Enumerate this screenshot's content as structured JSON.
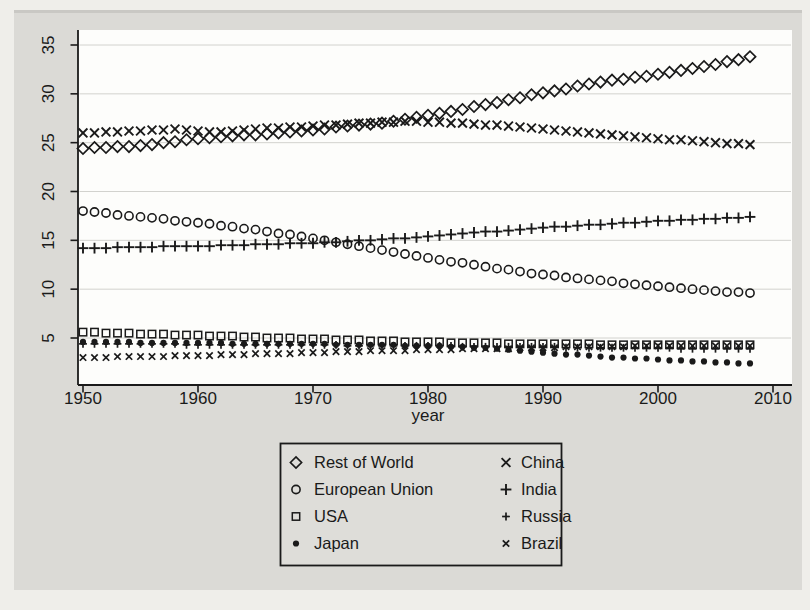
{
  "figure": {
    "xlabel": "year",
    "page_background": "#efeeea",
    "scan_background": "#dbdad6",
    "plot_background": "#fdfdfb",
    "ink_color": "#1a1a1a",
    "grid_color": "#d2d2ce",
    "legend_background": "#deddd9"
  },
  "chart_data": {
    "type": "scatter",
    "title": "",
    "xlabel": "year",
    "ylabel": "",
    "xlim": [
      1949.5,
      2011.5
    ],
    "ylim": [
      0.2,
      36.5
    ],
    "xticks": [
      1950,
      1960,
      1970,
      1980,
      1990,
      2000,
      2010
    ],
    "yticks": [
      5,
      10,
      15,
      20,
      25,
      30,
      35
    ],
    "grid": "horizontal",
    "legend_position": "below-plot",
    "legend_columns": [
      [
        0,
        1,
        2,
        3
      ],
      [
        4,
        5,
        6,
        7
      ]
    ],
    "x": [
      1950,
      1951,
      1952,
      1953,
      1954,
      1955,
      1956,
      1957,
      1958,
      1959,
      1960,
      1961,
      1962,
      1963,
      1964,
      1965,
      1966,
      1967,
      1968,
      1969,
      1970,
      1971,
      1972,
      1973,
      1974,
      1975,
      1976,
      1977,
      1978,
      1979,
      1980,
      1981,
      1982,
      1983,
      1984,
      1985,
      1986,
      1987,
      1988,
      1989,
      1990,
      1991,
      1992,
      1993,
      1994,
      1995,
      1996,
      1997,
      1998,
      1999,
      2000,
      2001,
      2002,
      2003,
      2004,
      2005,
      2006,
      2007,
      2008
    ],
    "series": [
      {
        "name": "Rest of World",
        "marker": "diamond-hollow",
        "values": [
          24.4,
          24.5,
          24.5,
          24.6,
          24.6,
          24.7,
          24.8,
          25.0,
          25.1,
          25.3,
          25.4,
          25.5,
          25.6,
          25.7,
          25.8,
          25.8,
          25.9,
          26.0,
          26.1,
          26.2,
          26.3,
          26.4,
          26.6,
          26.7,
          26.8,
          26.9,
          27.0,
          27.2,
          27.4,
          27.6,
          27.8,
          28.0,
          28.2,
          28.4,
          28.7,
          28.9,
          29.1,
          29.4,
          29.6,
          29.9,
          30.1,
          30.3,
          30.5,
          30.8,
          31.0,
          31.2,
          31.4,
          31.5,
          31.7,
          31.8,
          32.0,
          32.2,
          32.4,
          32.6,
          32.8,
          33.0,
          33.3,
          33.5,
          33.8
        ]
      },
      {
        "name": "European Union",
        "marker": "circle-hollow",
        "values": [
          18.0,
          17.9,
          17.8,
          17.6,
          17.5,
          17.4,
          17.3,
          17.2,
          17.0,
          16.9,
          16.8,
          16.7,
          16.5,
          16.4,
          16.2,
          16.1,
          15.9,
          15.7,
          15.6,
          15.4,
          15.2,
          15.0,
          14.8,
          14.6,
          14.4,
          14.2,
          14.0,
          13.8,
          13.6,
          13.4,
          13.2,
          13.0,
          12.8,
          12.7,
          12.5,
          12.3,
          12.1,
          12.0,
          11.8,
          11.6,
          11.5,
          11.4,
          11.2,
          11.1,
          11.0,
          10.9,
          10.8,
          10.6,
          10.5,
          10.4,
          10.3,
          10.2,
          10.1,
          10.0,
          9.9,
          9.8,
          9.7,
          9.7,
          9.6
        ]
      },
      {
        "name": "USA",
        "marker": "square-hollow",
        "values": [
          5.6,
          5.6,
          5.5,
          5.5,
          5.5,
          5.4,
          5.4,
          5.4,
          5.3,
          5.3,
          5.3,
          5.2,
          5.2,
          5.2,
          5.1,
          5.1,
          5.0,
          5.0,
          5.0,
          4.9,
          4.9,
          4.9,
          4.8,
          4.8,
          4.8,
          4.7,
          4.7,
          4.7,
          4.6,
          4.6,
          4.6,
          4.6,
          4.5,
          4.5,
          4.5,
          4.5,
          4.5,
          4.4,
          4.4,
          4.4,
          4.4,
          4.4,
          4.4,
          4.4,
          4.4,
          4.3,
          4.3,
          4.3,
          4.3,
          4.3,
          4.3,
          4.3,
          4.3,
          4.3,
          4.3,
          4.3,
          4.3,
          4.3,
          4.3
        ]
      },
      {
        "name": "Japan",
        "marker": "circle-filled",
        "values": [
          4.6,
          4.6,
          4.6,
          4.6,
          4.6,
          4.5,
          4.5,
          4.5,
          4.5,
          4.5,
          4.5,
          4.5,
          4.5,
          4.4,
          4.4,
          4.4,
          4.4,
          4.4,
          4.4,
          4.4,
          4.4,
          4.4,
          4.3,
          4.3,
          4.3,
          4.3,
          4.3,
          4.3,
          4.2,
          4.2,
          4.2,
          4.2,
          4.1,
          4.1,
          4.0,
          4.0,
          3.9,
          3.8,
          3.7,
          3.6,
          3.5,
          3.4,
          3.3,
          3.3,
          3.2,
          3.1,
          3.0,
          3.0,
          2.9,
          2.9,
          2.8,
          2.7,
          2.7,
          2.6,
          2.6,
          2.5,
          2.5,
          2.4,
          2.4
        ]
      },
      {
        "name": "China",
        "marker": "x-large",
        "values": [
          26.0,
          26.0,
          26.1,
          26.1,
          26.2,
          26.2,
          26.3,
          26.3,
          26.4,
          26.3,
          26.2,
          26.1,
          26.1,
          26.2,
          26.3,
          26.4,
          26.5,
          26.5,
          26.6,
          26.6,
          26.7,
          26.8,
          26.8,
          26.9,
          27.0,
          27.0,
          27.1,
          27.1,
          27.2,
          27.2,
          27.1,
          27.1,
          27.0,
          27.0,
          26.9,
          26.8,
          26.8,
          26.7,
          26.6,
          26.5,
          26.4,
          26.3,
          26.2,
          26.1,
          26.0,
          25.9,
          25.8,
          25.7,
          25.6,
          25.5,
          25.4,
          25.3,
          25.3,
          25.2,
          25.1,
          25.0,
          24.9,
          24.9,
          24.8
        ]
      },
      {
        "name": "India",
        "marker": "plus-large",
        "values": [
          14.2,
          14.2,
          14.2,
          14.3,
          14.3,
          14.3,
          14.3,
          14.4,
          14.4,
          14.4,
          14.4,
          14.4,
          14.5,
          14.5,
          14.5,
          14.6,
          14.6,
          14.6,
          14.7,
          14.7,
          14.7,
          14.8,
          14.8,
          14.9,
          15.0,
          15.0,
          15.1,
          15.2,
          15.2,
          15.3,
          15.4,
          15.5,
          15.6,
          15.7,
          15.8,
          15.9,
          15.9,
          16.0,
          16.1,
          16.2,
          16.3,
          16.4,
          16.4,
          16.5,
          16.6,
          16.6,
          16.7,
          16.8,
          16.8,
          16.9,
          17.0,
          17.0,
          17.1,
          17.1,
          17.2,
          17.2,
          17.3,
          17.3,
          17.4
        ]
      },
      {
        "name": "Russia",
        "marker": "plus-small",
        "values": [
          4.4,
          4.4,
          4.4,
          4.4,
          4.4,
          4.4,
          4.4,
          4.4,
          4.4,
          4.3,
          4.3,
          4.3,
          4.3,
          4.3,
          4.3,
          4.3,
          4.3,
          4.3,
          4.3,
          4.3,
          4.3,
          4.3,
          4.3,
          4.2,
          4.2,
          4.2,
          4.2,
          4.2,
          4.2,
          4.2,
          4.2,
          4.2,
          4.2,
          4.1,
          4.1,
          4.1,
          4.1,
          4.1,
          4.1,
          4.1,
          4.1,
          4.1,
          4.0,
          4.0,
          4.0,
          4.0,
          4.0,
          4.0,
          4.0,
          4.0,
          4.0,
          4.0,
          3.9,
          3.9,
          3.9,
          3.9,
          3.9,
          3.9,
          3.9
        ]
      },
      {
        "name": "Brazil",
        "marker": "x-small",
        "values": [
          3.0,
          3.0,
          3.0,
          3.1,
          3.1,
          3.1,
          3.1,
          3.1,
          3.2,
          3.2,
          3.2,
          3.2,
          3.3,
          3.3,
          3.3,
          3.4,
          3.4,
          3.4,
          3.4,
          3.5,
          3.5,
          3.5,
          3.6,
          3.6,
          3.6,
          3.7,
          3.7,
          3.7,
          3.7,
          3.8,
          3.8,
          3.8,
          3.8,
          3.9,
          3.9,
          3.9,
          3.9,
          3.9,
          4.0,
          4.0,
          4.0,
          4.0,
          4.1,
          4.1,
          4.1,
          4.1,
          4.1,
          4.1,
          4.2,
          4.2,
          4.2,
          4.2,
          4.2,
          4.2,
          4.2,
          4.2,
          4.2,
          4.2,
          4.2
        ]
      }
    ]
  }
}
